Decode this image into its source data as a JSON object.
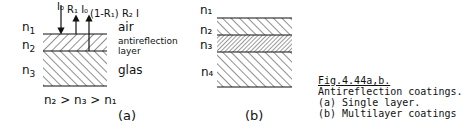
{
  "figure": {
    "panel_a": {
      "labels": {
        "n1": "n",
        "n1_sub": "1",
        "n2": "n",
        "n2_sub": "2",
        "n3": "n",
        "n3_sub": "3"
      },
      "media": {
        "air": "air",
        "layer1": "antireflection",
        "layer2": "layer",
        "glas": "glas"
      },
      "beams": {
        "incident": "I₀",
        "r1": "R₁ I₀",
        "r2": "(1-R₁) R₂ I"
      },
      "condition": "n₂ > n₃ > n₁",
      "panel_label": "(a)"
    },
    "panel_b": {
      "labels": [
        "n₁",
        "n₂",
        "n₃",
        "n₄"
      ],
      "panel_label": "(b)"
    },
    "caption": {
      "title": "Fig.4.44a,b.",
      "lines": [
        "Antireflection coatings.",
        "(a) Single layer.",
        "(b) Multilayer coatings"
      ]
    }
  }
}
